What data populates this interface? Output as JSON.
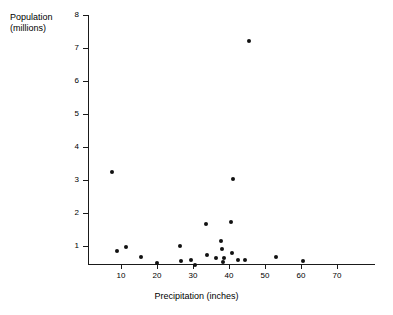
{
  "chart_data": {
    "type": "scatter",
    "title": "",
    "xlabel": "Precipitation (inches)",
    "ylabel": "Population\n(millions)",
    "ylabel_line1": "Population",
    "ylabel_line2": "(millions)",
    "xlim": [
      3,
      82
    ],
    "ylim": [
      0,
      8
    ],
    "xticks": [
      10,
      20,
      30,
      40,
      50,
      60,
      70
    ],
    "yticks": [
      1,
      2,
      3,
      4,
      5,
      6,
      7,
      8
    ],
    "xtick_labels": [
      "10",
      "20",
      "30",
      "40",
      "50",
      "60",
      "70"
    ],
    "ytick_labels": [
      "1",
      "2",
      "3",
      "4",
      "5",
      "6",
      "7",
      "8"
    ],
    "grid": false,
    "legend": false,
    "marker_color": "#111111",
    "axis_color": "#1a1a1a",
    "background": "#ffffff",
    "points": [
      {
        "x": 7.5,
        "y": 3.25
      },
      {
        "x": 9.0,
        "y": 0.85
      },
      {
        "x": 11.5,
        "y": 0.97
      },
      {
        "x": 15.5,
        "y": 0.68
      },
      {
        "x": 20.0,
        "y": 0.47
      },
      {
        "x": 26.5,
        "y": 1.0
      },
      {
        "x": 26.8,
        "y": 0.56
      },
      {
        "x": 29.5,
        "y": 0.57
      },
      {
        "x": 30.5,
        "y": 0.43
      },
      {
        "x": 33.5,
        "y": 1.68
      },
      {
        "x": 33.8,
        "y": 0.72
      },
      {
        "x": 36.5,
        "y": 0.64
      },
      {
        "x": 37.8,
        "y": 1.15
      },
      {
        "x": 38.0,
        "y": 0.92
      },
      {
        "x": 38.2,
        "y": 0.52
      },
      {
        "x": 38.5,
        "y": 0.65
      },
      {
        "x": 40.5,
        "y": 1.72
      },
      {
        "x": 41.0,
        "y": 3.03
      },
      {
        "x": 40.8,
        "y": 0.78
      },
      {
        "x": 42.5,
        "y": 0.58
      },
      {
        "x": 44.5,
        "y": 0.58
      },
      {
        "x": 45.5,
        "y": 7.2
      },
      {
        "x": 53.0,
        "y": 0.68
      },
      {
        "x": 60.5,
        "y": 0.55
      }
    ]
  }
}
